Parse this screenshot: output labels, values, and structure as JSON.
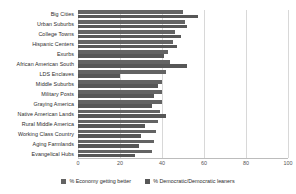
{
  "chart_data": {
    "type": "bar",
    "orientation": "horizontal",
    "grouped": true,
    "title": "",
    "subtitle": "",
    "xlabel": "",
    "ylabel": "",
    "xlim": [
      0,
      100
    ],
    "xticks": [
      0,
      20,
      40,
      60,
      80,
      100
    ],
    "grid": true,
    "grid_axis": "x",
    "legend_position": "bottom",
    "categories": [
      "Big Cities",
      "Urban Suburbs",
      "College Towns",
      "Hispanic Centers",
      "Exurbs",
      "African American South",
      "LDS Enclaves",
      "Middle Suburbs",
      "Military Posts",
      "Graying America",
      "Native American Lands",
      "Rural Middle America",
      "Working Class Country",
      "Aging Farmlands",
      "Evangelical Hubs"
    ],
    "series": [
      {
        "name": "% Economy getting better",
        "color": "#636363",
        "values": [
          50,
          51,
          46,
          45,
          43,
          44,
          42,
          40,
          40,
          40,
          39,
          38,
          37,
          36,
          35
        ]
      },
      {
        "name": "% Democratic/Democratic leaners",
        "color": "#575757",
        "values": [
          57,
          52,
          49,
          47,
          41,
          52,
          20,
          38,
          36,
          35,
          42,
          32,
          30,
          29,
          27
        ]
      }
    ]
  },
  "legend": {
    "items": [
      {
        "label": "% Economy getting better",
        "color": "#636363"
      },
      {
        "label": "% Democratic/Democratic leaners",
        "color": "#575757"
      }
    ]
  }
}
